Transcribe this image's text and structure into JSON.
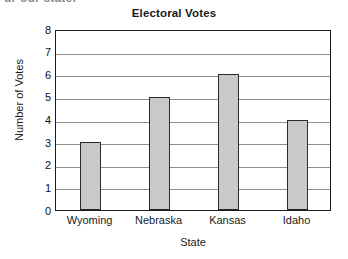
{
  "clipped_header_text": "ur our state.",
  "chart_data": {
    "type": "bar",
    "title": "Electoral Votes",
    "xlabel": "State",
    "ylabel": "Number of Votes",
    "categories": [
      "Wyoming",
      "Nebraska",
      "Kansas",
      "Idaho"
    ],
    "values": [
      3,
      5,
      6,
      4
    ],
    "ylim": [
      0,
      8
    ],
    "ytick_labels": [
      "0",
      "1",
      "2",
      "3",
      "4",
      "5",
      "6",
      "7",
      "8"
    ],
    "ytick_values": [
      0,
      1,
      2,
      3,
      4,
      5,
      6,
      7,
      8
    ],
    "grid": "horizontal",
    "legend": "none",
    "bar_fill_color": "#c9c9c9",
    "bar_border_color": "#2a2a2a",
    "gridline_color": "#8e8e8e",
    "frame_color": "#1a1a1a",
    "background_color": "#ffffff"
  }
}
